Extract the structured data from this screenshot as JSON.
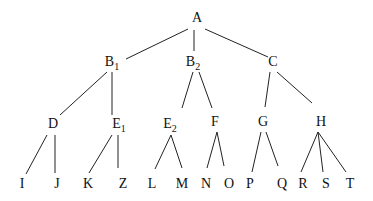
{
  "diagram": {
    "type": "tree",
    "root": "A",
    "nodes": [
      {
        "id": "A",
        "label": "A",
        "sub": "",
        "x": 197,
        "y": 22
      },
      {
        "id": "B1",
        "label": "B",
        "sub": "1",
        "x": 112,
        "y": 66
      },
      {
        "id": "B2",
        "label": "B",
        "sub": "2",
        "x": 193,
        "y": 66
      },
      {
        "id": "C",
        "label": "C",
        "sub": "",
        "x": 273,
        "y": 66
      },
      {
        "id": "D",
        "label": "D",
        "sub": "",
        "x": 53,
        "y": 128
      },
      {
        "id": "E1",
        "label": "E",
        "sub": "1",
        "x": 119,
        "y": 128
      },
      {
        "id": "E2",
        "label": "E",
        "sub": "2",
        "x": 170,
        "y": 128
      },
      {
        "id": "F",
        "label": "F",
        "sub": "",
        "x": 215,
        "y": 126
      },
      {
        "id": "G",
        "label": "G",
        "sub": "",
        "x": 263,
        "y": 126
      },
      {
        "id": "H",
        "label": "H",
        "sub": "",
        "x": 321,
        "y": 126
      },
      {
        "id": "I",
        "label": "I",
        "sub": "",
        "x": 22,
        "y": 188
      },
      {
        "id": "J",
        "label": "J",
        "sub": "",
        "x": 57,
        "y": 188
      },
      {
        "id": "K",
        "label": "K",
        "sub": "",
        "x": 88,
        "y": 188
      },
      {
        "id": "Z",
        "label": "Z",
        "sub": "",
        "x": 123,
        "y": 188
      },
      {
        "id": "L",
        "label": "L",
        "sub": "",
        "x": 152,
        "y": 188
      },
      {
        "id": "M",
        "label": "M",
        "sub": "",
        "x": 182,
        "y": 188
      },
      {
        "id": "N",
        "label": "N",
        "sub": "",
        "x": 206,
        "y": 188
      },
      {
        "id": "O",
        "label": "O",
        "sub": "",
        "x": 229,
        "y": 188
      },
      {
        "id": "P",
        "label": "P",
        "sub": "",
        "x": 250,
        "y": 188
      },
      {
        "id": "Q",
        "label": "Q",
        "sub": "",
        "x": 282,
        "y": 188
      },
      {
        "id": "R",
        "label": "R",
        "sub": "",
        "x": 303,
        "y": 188
      },
      {
        "id": "S",
        "label": "S",
        "sub": "",
        "x": 326,
        "y": 188
      },
      {
        "id": "T",
        "label": "T",
        "sub": "",
        "x": 350,
        "y": 188
      }
    ],
    "edges": [
      {
        "from": "A",
        "to": "B1",
        "x1": 188,
        "y1": 29,
        "x2": 126,
        "y2": 59
      },
      {
        "from": "A",
        "to": "B2",
        "x1": 194,
        "y1": 30,
        "x2": 194,
        "y2": 51
      },
      {
        "from": "A",
        "to": "C",
        "x1": 205,
        "y1": 29,
        "x2": 268,
        "y2": 57
      },
      {
        "from": "B1",
        "to": "D",
        "x1": 107,
        "y1": 72,
        "x2": 60,
        "y2": 115
      },
      {
        "from": "B1",
        "to": "E1",
        "x1": 112,
        "y1": 72,
        "x2": 112,
        "y2": 115
      },
      {
        "from": "B2",
        "to": "E2",
        "x1": 193,
        "y1": 72,
        "x2": 182,
        "y2": 108
      },
      {
        "from": "B2",
        "to": "F",
        "x1": 199,
        "y1": 72,
        "x2": 212,
        "y2": 108
      },
      {
        "from": "C",
        "to": "G",
        "x1": 270,
        "y1": 72,
        "x2": 265,
        "y2": 107
      },
      {
        "from": "C",
        "to": "H",
        "x1": 277,
        "y1": 72,
        "x2": 312,
        "y2": 103
      },
      {
        "from": "D",
        "to": "I",
        "x1": 47,
        "y1": 135,
        "x2": 26,
        "y2": 174
      },
      {
        "from": "D",
        "to": "J",
        "x1": 55,
        "y1": 135,
        "x2": 55,
        "y2": 173
      },
      {
        "from": "E1",
        "to": "K",
        "x1": 112,
        "y1": 135,
        "x2": 89,
        "y2": 173
      },
      {
        "from": "E1",
        "to": "Z",
        "x1": 118,
        "y1": 135,
        "x2": 118,
        "y2": 168
      },
      {
        "from": "E2",
        "to": "L",
        "x1": 171,
        "y1": 135,
        "x2": 155,
        "y2": 169
      },
      {
        "from": "E2",
        "to": "M",
        "x1": 171,
        "y1": 135,
        "x2": 182,
        "y2": 168
      },
      {
        "from": "F",
        "to": "N",
        "x1": 217,
        "y1": 132,
        "x2": 207,
        "y2": 168
      },
      {
        "from": "F",
        "to": "O",
        "x1": 217,
        "y1": 132,
        "x2": 224,
        "y2": 166
      },
      {
        "from": "G",
        "to": "P",
        "x1": 261,
        "y1": 132,
        "x2": 252,
        "y2": 172
      },
      {
        "from": "G",
        "to": "Q",
        "x1": 266,
        "y1": 132,
        "x2": 278,
        "y2": 166
      },
      {
        "from": "H",
        "to": "R",
        "x1": 318,
        "y1": 132,
        "x2": 301,
        "y2": 172
      },
      {
        "from": "H",
        "to": "S",
        "x1": 318,
        "y1": 132,
        "x2": 323,
        "y2": 172
      },
      {
        "from": "H",
        "to": "T",
        "x1": 318,
        "y1": 132,
        "x2": 346,
        "y2": 172
      }
    ]
  }
}
